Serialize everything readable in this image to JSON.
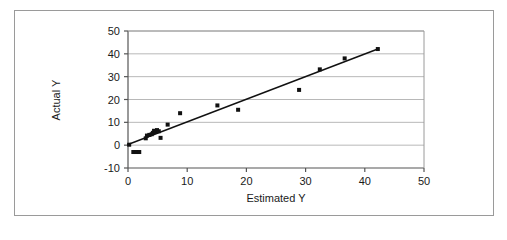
{
  "figure": {
    "border_color": "#9a9a9a",
    "background": "#ffffff"
  },
  "chart_data": {
    "type": "scatter",
    "title": "",
    "xlabel": "Estimated Y",
    "ylabel": "Actual Y",
    "xlim": [
      0,
      50
    ],
    "ylim": [
      -10,
      50
    ],
    "xticks": [
      0,
      10,
      20,
      30,
      40,
      50
    ],
    "yticks": [
      -10,
      0,
      10,
      20,
      30,
      40,
      50
    ],
    "xtick_labels": [
      "0",
      "10",
      "20",
      "30",
      "40",
      "50"
    ],
    "ytick_labels": [
      "-10",
      "0",
      "10",
      "20",
      "30",
      "40",
      "50"
    ],
    "grid": {
      "horizontal": true,
      "vertical": false,
      "color": "#b8b8b8"
    },
    "legend": {
      "visible": false,
      "position": "none"
    },
    "marker": {
      "shape": "square",
      "color": "#111111",
      "size": 4
    },
    "series": [
      {
        "name": "Actual Y",
        "type": "scatter",
        "points": [
          [
            0.2,
            0.2
          ],
          [
            0.9,
            -3.0
          ],
          [
            1.4,
            -3.0
          ],
          [
            1.9,
            -3.0
          ],
          [
            3.0,
            3.0
          ],
          [
            3.2,
            4.2
          ],
          [
            3.6,
            4.5
          ],
          [
            4.0,
            4.8
          ],
          [
            4.2,
            5.4
          ],
          [
            4.4,
            6.3
          ],
          [
            4.6,
            5.8
          ],
          [
            4.9,
            6.6
          ],
          [
            5.2,
            6.1
          ],
          [
            5.5,
            3.2
          ],
          [
            6.7,
            9.0
          ],
          [
            8.8,
            14.0
          ],
          [
            15.1,
            17.4
          ],
          [
            18.6,
            15.5
          ],
          [
            28.9,
            24.2
          ],
          [
            32.4,
            33.2
          ],
          [
            36.6,
            38.0
          ],
          [
            42.2,
            42.1
          ]
        ]
      },
      {
        "name": "Trend line",
        "type": "line",
        "color": "#111111",
        "width": 1.5,
        "endpoints": [
          [
            0.0,
            0.3
          ],
          [
            42.3,
            42.2
          ]
        ]
      }
    ]
  }
}
